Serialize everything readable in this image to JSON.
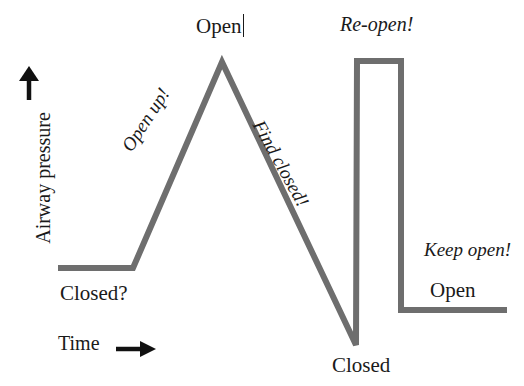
{
  "figure": {
    "background_color": "#ffffff",
    "trace_color": "#6e6e6e",
    "text_color": "#1a1a1a",
    "axes": {
      "y_label": "Airway pressure",
      "y_arrow_icon": "up-arrow-icon",
      "x_label": "Time",
      "x_arrow_icon": "right-arrow-icon"
    },
    "annotations": {
      "open_top": "Open",
      "open_up": "Open up!",
      "find_closed": "Find closed!",
      "reopen": "Re-open!",
      "keep_open": "Keep open!",
      "open_bottom": "Open",
      "closed_question": "Closed?",
      "closed_bottom": "Closed"
    }
  },
  "chart_data": {
    "type": "line",
    "xlabel": "Time",
    "ylabel": "Airway pressure",
    "xlim": [
      0,
      524
    ],
    "ylim": [
      386,
      0
    ],
    "grid": false,
    "legend": "none",
    "series": [
      {
        "name": "Airway pressure",
        "color": "#6e6e6e",
        "line_width": 6,
        "points": [
          [
            58,
            268
          ],
          [
            133,
            268
          ],
          [
            222,
            62
          ],
          [
            356,
            345
          ],
          [
            357,
            61
          ],
          [
            401,
            61
          ],
          [
            401,
            310
          ],
          [
            507,
            310
          ]
        ],
        "point_labels": [
          "baseline start (Closed?)",
          "baseline end / start of rise",
          "peak (Open)",
          "trough (Closed)",
          "square pulse top-left (Re-open!)",
          "square pulse top-right",
          "square pulse bottom-right",
          "final plateau end (Open / Keep open!)"
        ]
      }
    ],
    "annotations": [
      {
        "text": "Open",
        "x": 222,
        "y": 24,
        "style": "roman",
        "rotation": 0
      },
      {
        "text": "Open up!",
        "x": 160,
        "y": 148,
        "style": "italic",
        "rotation": -57
      },
      {
        "text": "Find closed!",
        "x": 292,
        "y": 150,
        "style": "italic",
        "rotation": 61
      },
      {
        "text": "Re-open!",
        "x": 385,
        "y": 24,
        "style": "italic",
        "rotation": 0
      },
      {
        "text": "Keep open!",
        "x": 472,
        "y": 250,
        "style": "italic",
        "rotation": 0
      },
      {
        "text": "Open",
        "x": 458,
        "y": 290,
        "style": "roman",
        "rotation": 0
      },
      {
        "text": "Closed?",
        "x": 96,
        "y": 293,
        "style": "roman",
        "rotation": 0
      },
      {
        "text": "Closed",
        "x": 364,
        "y": 365,
        "style": "roman",
        "rotation": 0
      }
    ]
  }
}
